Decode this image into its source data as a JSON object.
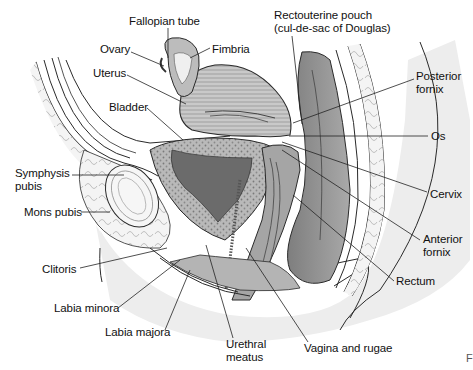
{
  "figure": {
    "type": "anatomical-sagittal-section",
    "colors": {
      "skin_shade": "#e9e9e9",
      "tissue_mid": "#9a9a9a",
      "tissue_dark": "#5f5f5f",
      "outline": "#2a2a2a",
      "label_text": "#111111"
    },
    "labels": [
      {
        "id": "fallopian-tube",
        "text": "Fallopian tube",
        "x": 129,
        "y": 15
      },
      {
        "id": "ovary",
        "text": "Ovary",
        "x": 100,
        "y": 43
      },
      {
        "id": "fimbria",
        "text": "Fimbria",
        "x": 212,
        "y": 43
      },
      {
        "id": "uterus",
        "text": "Uterus",
        "x": 93,
        "y": 67
      },
      {
        "id": "bladder",
        "text": "Bladder",
        "x": 109,
        "y": 101
      },
      {
        "id": "rectouterine-pouch",
        "text": "Rectouterine pouch\n(cul-de-sac of Douglas)",
        "x": 274,
        "y": 9
      },
      {
        "id": "posterior-fornix",
        "text": "Posterior\nfornix",
        "x": 416,
        "y": 70
      },
      {
        "id": "os",
        "text": "Os",
        "x": 431,
        "y": 130
      },
      {
        "id": "symphysis-pubis",
        "text": "Symphysis\npubis",
        "x": 15,
        "y": 167
      },
      {
        "id": "mons-pubis",
        "text": "Mons pubis",
        "x": 24,
        "y": 206
      },
      {
        "id": "cervix",
        "text": "Cervix",
        "x": 430,
        "y": 188
      },
      {
        "id": "anterior-fornix",
        "text": "Anterior\nfornix",
        "x": 423,
        "y": 233
      },
      {
        "id": "clitoris",
        "text": "Clitoris",
        "x": 42,
        "y": 263
      },
      {
        "id": "rectum",
        "text": "Rectum",
        "x": 396,
        "y": 275
      },
      {
        "id": "labia-minora",
        "text": "Labia minora",
        "x": 54,
        "y": 302
      },
      {
        "id": "labia-majora",
        "text": "Labia majora",
        "x": 105,
        "y": 326
      },
      {
        "id": "urethral-meatus",
        "text": "Urethral\nmeatus",
        "x": 226,
        "y": 338
      },
      {
        "id": "vagina-and-rugae",
        "text": "Vagina and rugae",
        "x": 304,
        "y": 342
      }
    ],
    "corner_mark": "F"
  }
}
